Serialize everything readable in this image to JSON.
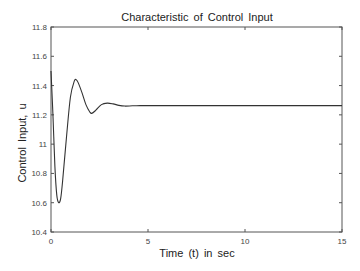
{
  "chart_data": {
    "type": "line",
    "title": "Characteristic of Control Input",
    "xlabel": "Time  (t)  in  sec",
    "ylabel": "Control  Input,  u",
    "xlim": [
      0,
      15
    ],
    "ylim": [
      10.4,
      11.8
    ],
    "xticks": [
      "0",
      "5",
      "10",
      "15"
    ],
    "yticks": [
      "10.4",
      "10.6",
      "10.8",
      "11",
      "11.2",
      "11.4",
      "11.6",
      "11.8"
    ],
    "grid": false,
    "legend": null,
    "series": [
      {
        "name": "u",
        "color": "#333333",
        "x": [
          0,
          0.1,
          0.2,
          0.3,
          0.4,
          0.5,
          0.6,
          0.8,
          1.0,
          1.2,
          1.3,
          1.4,
          1.6,
          1.8,
          2.0,
          2.1,
          2.3,
          2.6,
          2.9,
          3.2,
          3.5,
          3.8,
          4.2,
          4.6,
          5,
          6,
          8,
          10,
          12,
          15
        ],
        "values": [
          11.5,
          11.2,
          10.85,
          10.65,
          10.6,
          10.63,
          10.75,
          11.05,
          11.32,
          11.43,
          11.44,
          11.42,
          11.35,
          11.27,
          11.22,
          11.21,
          11.23,
          11.27,
          11.28,
          11.275,
          11.265,
          11.26,
          11.262,
          11.263,
          11.263,
          11.263,
          11.263,
          11.263,
          11.263,
          11.263
        ]
      }
    ]
  }
}
